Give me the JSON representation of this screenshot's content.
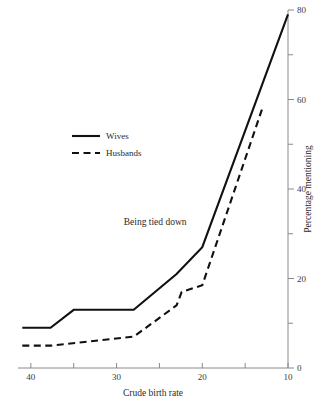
{
  "chart_data": {
    "type": "line",
    "title": "",
    "subtitle": "",
    "xlabel": "Crude birth rate",
    "ylabel": "Percentage mentioning",
    "xlim": [
      41.5,
      10
    ],
    "ylim": [
      0,
      80
    ],
    "x_axis_reversed": true,
    "y_axis_position": "right",
    "grid": false,
    "legend_position": "upper-left-inside",
    "x_ticks": [
      40,
      35,
      30,
      25,
      20,
      15,
      10
    ],
    "x_tick_labels": [
      "40",
      "",
      "30",
      "",
      "20",
      "",
      "10"
    ],
    "y_ticks": [
      0,
      10,
      20,
      30,
      40,
      50,
      60,
      70,
      80
    ],
    "y_tick_labels": [
      "0",
      "",
      "20",
      "",
      "40",
      "",
      "60",
      "",
      "80"
    ],
    "annotations": [
      {
        "text": "Being tied down",
        "x": 25.5,
        "y": 32
      }
    ],
    "series": [
      {
        "name": "Wives",
        "style": "solid",
        "color": "#111111",
        "points": [
          {
            "x": 41.0,
            "y": 9.0
          },
          {
            "x": 37.7,
            "y": 9.0
          },
          {
            "x": 35.0,
            "y": 13.0
          },
          {
            "x": 28.0,
            "y": 13.0
          },
          {
            "x": 23.0,
            "y": 21.0
          },
          {
            "x": 20.0,
            "y": 27.0
          },
          {
            "x": 10.0,
            "y": 79.0
          }
        ]
      },
      {
        "name": "Husbands",
        "style": "dashed",
        "color": "#111111",
        "points": [
          {
            "x": 41.0,
            "y": 5.0
          },
          {
            "x": 37.7,
            "y": 5.0
          },
          {
            "x": 28.0,
            "y": 7.0
          },
          {
            "x": 23.0,
            "y": 14.0
          },
          {
            "x": 22.4,
            "y": 17.0
          },
          {
            "x": 20.0,
            "y": 18.5
          },
          {
            "x": 13.0,
            "y": 58.0
          }
        ]
      }
    ]
  },
  "legend": {
    "entries": [
      {
        "label": "Wives",
        "style": "solid"
      },
      {
        "label": "Husbands",
        "style": "dashed"
      }
    ]
  },
  "axes": {
    "x_title": "Crude birth rate",
    "y_title": "Percentage mentioning"
  }
}
